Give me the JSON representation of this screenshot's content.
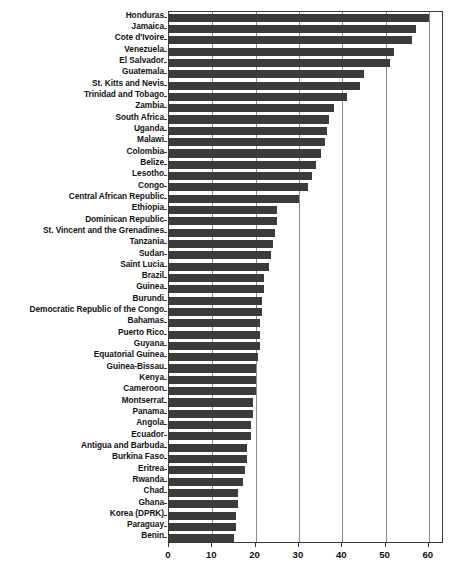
{
  "chart_data": {
    "type": "bar",
    "orientation": "horizontal",
    "title": "",
    "subtitle": "",
    "xlabel": "",
    "ylabel": "",
    "xlim": [
      0,
      63.5
    ],
    "ylim": null,
    "grid": true,
    "grid_axis": "x",
    "legend": null,
    "legend_position": "none",
    "bar_color": "#3b3b3b",
    "axis_color": "#3a3a3a",
    "gridline_color": "#8d8d8d",
    "xticks": [
      0,
      10,
      20,
      30,
      40,
      50,
      60
    ],
    "xticklabels": [
      "0",
      "10",
      "20",
      "30",
      "40",
      "50",
      "60"
    ],
    "categories": [
      "Honduras",
      "Jamaica",
      "Cote d'Ivoire",
      "Venezuela",
      "El Salvador",
      "Guatemala",
      "St. Kitts and Nevis",
      "Trinidad and Tobago",
      "Zambia",
      "South Africa",
      "Uganda",
      "Malawi",
      "Colombia",
      "Belize",
      "Lesotho",
      "Congo",
      "Central African Republic",
      "Ethiopia",
      "Dominican Republic",
      "St. Vincent and the Grenadines",
      "Tanzania",
      "Sudan",
      "Saint Lucia",
      "Brazil",
      "Guinea",
      "Burundi",
      "Democratic Republic of the Congo",
      "Bahamas",
      "Puerto Rico",
      "Guyana",
      "Equatorial Guinea",
      "Guinea-Bissau",
      "Kenya",
      "Cameroon",
      "Montserrat",
      "Panama",
      "Angola",
      "Ecuador",
      "Antigua and Barbuda",
      "Burkina Faso",
      "Eritrea",
      "Rwanda",
      "Chad",
      "Ghana",
      "Korea (DPRK)",
      "Paraguay",
      "Benin"
    ],
    "values": [
      60.0,
      57.0,
      56.0,
      52.0,
      51.0,
      45.0,
      44.0,
      41.0,
      38.0,
      37.0,
      36.5,
      36.0,
      35.0,
      34.0,
      33.0,
      32.0,
      30.0,
      25.0,
      25.0,
      24.5,
      24.0,
      23.5,
      23.0,
      22.0,
      22.0,
      21.5,
      21.5,
      21.0,
      21.0,
      21.0,
      20.5,
      20.0,
      20.0,
      20.0,
      19.5,
      19.5,
      19.0,
      19.0,
      18.0,
      18.0,
      17.5,
      17.0,
      16.0,
      16.0,
      15.5,
      15.5,
      15.0
    ]
  }
}
